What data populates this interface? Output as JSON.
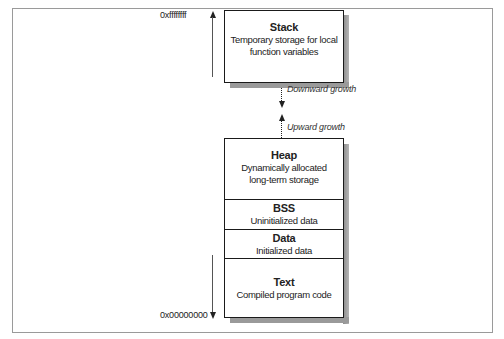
{
  "diagram": {
    "addresses": {
      "top": "0xffffffff",
      "bottom": "0x00000000"
    },
    "stack": {
      "title": "Stack",
      "description_line1": "Temporary storage for local",
      "description_line2": "function variables"
    },
    "growth": {
      "downward": "Downward growth",
      "upward": "Upward growth"
    },
    "segments": [
      {
        "title": "Heap",
        "description_line1": "Dynamically allocated",
        "description_line2": "long-term storage"
      },
      {
        "title": "BSS",
        "description_line1": "Uninitialized data"
      },
      {
        "title": "Data",
        "description_line1": "Initialized data"
      },
      {
        "title": "Text",
        "description_line1": "Compiled program code"
      }
    ],
    "colors": {
      "border": "#1a1a1a",
      "shadow": "#8a8a8a",
      "frame": "#9a9a9a",
      "background": "#ffffff"
    }
  }
}
